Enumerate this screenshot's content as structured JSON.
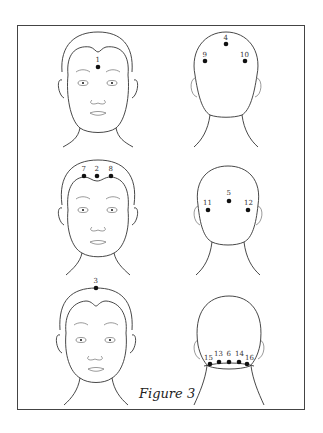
{
  "figure": {
    "caption": "Figure 3",
    "rows": [
      {
        "front": {
          "points": [
            {
              "label": "1",
              "x": 98,
              "y": 67
            }
          ]
        },
        "back": {
          "points": [
            {
              "label": "4",
              "x": 226,
              "y": 44
            },
            {
              "label": "9",
              "x": 205,
              "y": 61
            },
            {
              "label": "10",
              "x": 245,
              "y": 61
            }
          ]
        }
      },
      {
        "front": {
          "points": [
            {
              "label": "7",
              "x": 84,
              "y": 175
            },
            {
              "label": "2",
              "x": 97,
              "y": 175
            },
            {
              "label": "8",
              "x": 111,
              "y": 175
            }
          ]
        },
        "back": {
          "points": [
            {
              "label": "5",
              "x": 229,
              "y": 200
            },
            {
              "label": "11",
              "x": 208,
              "y": 210
            },
            {
              "label": "12",
              "x": 248,
              "y": 210
            }
          ]
        }
      },
      {
        "front": {
          "points": [
            {
              "label": "3",
              "x": 96,
              "y": 288
            }
          ]
        },
        "back": {
          "points": [
            {
              "label": "15",
              "x": 210,
              "y": 364
            },
            {
              "label": "13",
              "x": 219,
              "y": 362
            },
            {
              "label": "6",
              "x": 229,
              "y": 362
            },
            {
              "label": "14",
              "x": 239,
              "y": 362
            },
            {
              "label": "16",
              "x": 247,
              "y": 364
            }
          ]
        }
      }
    ]
  }
}
